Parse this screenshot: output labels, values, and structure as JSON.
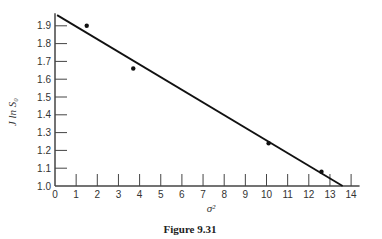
{
  "figure": {
    "caption": "Figure 9.31"
  },
  "chart_data": {
    "type": "scatter",
    "title": "",
    "xlabel": "σ²",
    "ylabel": "J ln S₀",
    "xlim": [
      0,
      14
    ],
    "ylim": [
      1.0,
      1.95
    ],
    "x_ticks": [
      "0",
      "1",
      "2",
      "3",
      "4",
      "5",
      "6",
      "7",
      "8",
      "9",
      "10",
      "11",
      "12",
      "13",
      "14"
    ],
    "y_ticks": [
      "1.0",
      "1.1",
      "1.2",
      "1.3",
      "1.4",
      "1.5",
      "1.6",
      "1.7",
      "1.8",
      "1.9"
    ],
    "grid": false,
    "legend": null,
    "series": [
      {
        "name": "data points",
        "type": "scatter",
        "x": [
          1.5,
          3.7,
          10.1,
          12.6
        ],
        "y": [
          1.9,
          1.66,
          1.24,
          1.08
        ]
      },
      {
        "name": "fitted line",
        "type": "line",
        "x": [
          0.1,
          13.6
        ],
        "y": [
          1.96,
          1.0
        ]
      }
    ]
  }
}
